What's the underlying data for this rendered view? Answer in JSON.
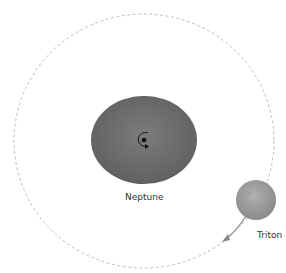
{
  "diagram": {
    "planet": {
      "name": "Neptune",
      "color": "#6a6a6a"
    },
    "moon": {
      "name": "Triton",
      "color": "#9a9a9a"
    },
    "orbit": {
      "style": "dashed",
      "color": "#b0b0b0"
    },
    "rotation_indicator": "counterclockwise-arrow",
    "orbit_direction": "clockwise-arrow"
  }
}
